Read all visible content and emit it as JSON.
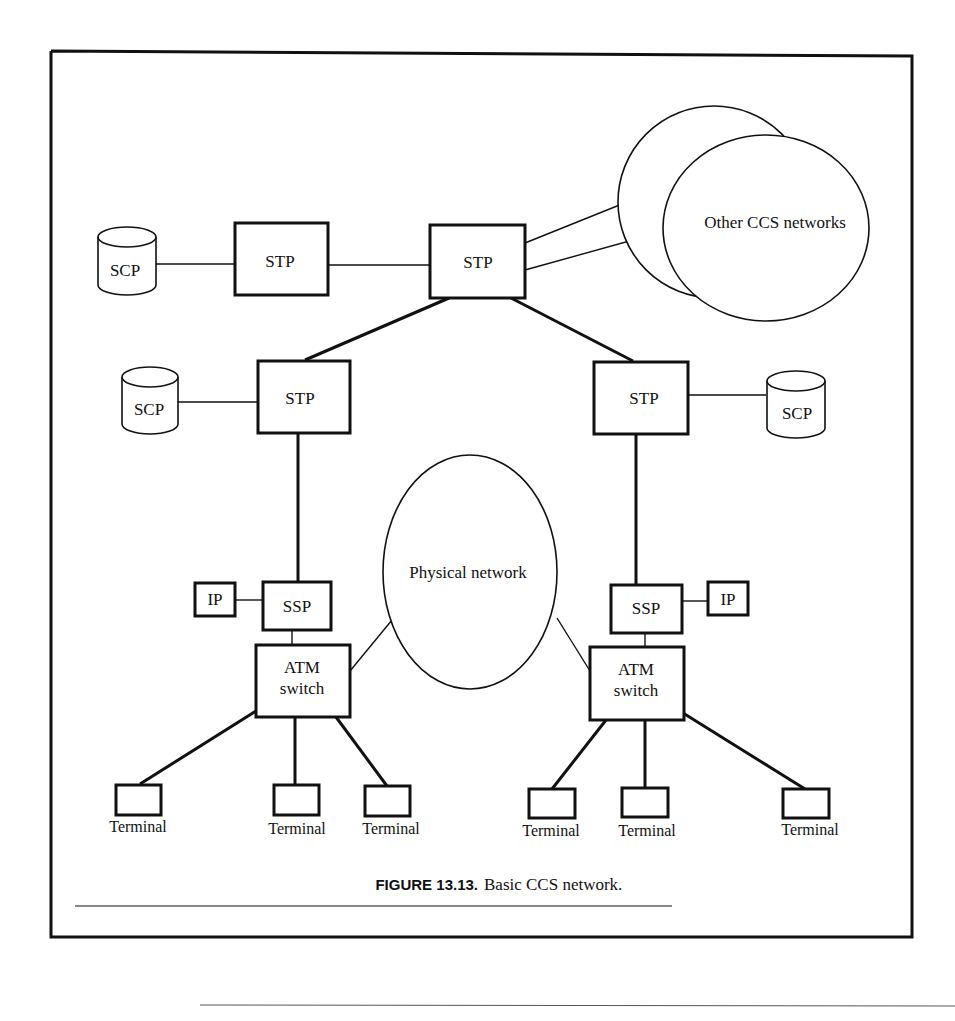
{
  "figure": {
    "caption_number": "FIGURE 13.13.",
    "caption_text": "Basic CCS network."
  },
  "nodes": {
    "stp_top_left": "STP",
    "stp_top_center": "STP",
    "stp_mid_left": "STP",
    "stp_mid_right": "STP",
    "scp_top": "SCP",
    "scp_mid_left": "SCP",
    "scp_mid_right": "SCP",
    "other_ccs": "Other CCS networks",
    "physical_network": "Physical network",
    "ssp_left": "SSP",
    "ssp_right": "SSP",
    "ip_left": "IP",
    "ip_right": "IP",
    "atm_left_line1": "ATM",
    "atm_left_line2": "switch",
    "atm_right_line1": "ATM",
    "atm_right_line2": "switch",
    "terminals": [
      "Terminal",
      "Terminal",
      "Terminal",
      "Terminal",
      "Terminal",
      "Terminal"
    ]
  }
}
